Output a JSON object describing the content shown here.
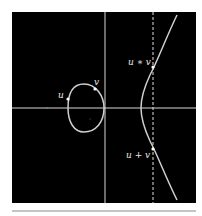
{
  "figure": {
    "type": "elliptic-curve-group-law",
    "colors": {
      "background": "#000000",
      "axis": "#d8d8d8",
      "curve": "#cfcfcf",
      "dashed_line": "#e0e0e0",
      "rule": "#b0b0b0",
      "page": "#ffffff"
    },
    "points": [
      {
        "id": "u",
        "label": "u",
        "x": 68,
        "y": 99
      },
      {
        "id": "v",
        "label": "v",
        "x": 95,
        "y": 89
      },
      {
        "id": "u_star_v",
        "label": "u ∗ v",
        "x": 153,
        "y": 67
      },
      {
        "id": "u_plus_v",
        "label": "u + v",
        "x": 153,
        "y": 149
      }
    ]
  }
}
